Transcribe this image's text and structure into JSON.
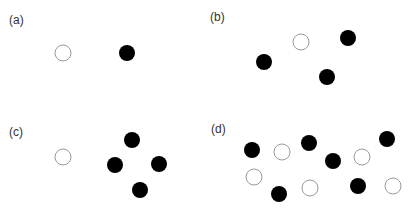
{
  "figure": {
    "panels": [
      {
        "label": "(a)",
        "label_pos": [
          9,
          14
        ],
        "circles": [
          {
            "x": 63,
            "y": 53,
            "filled": false
          },
          {
            "x": 127,
            "y": 53,
            "filled": true
          }
        ]
      },
      {
        "label": "(b)",
        "label_pos": [
          210,
          11
        ],
        "circles": [
          {
            "x": 301,
            "y": 42,
            "filled": false
          },
          {
            "x": 348,
            "y": 38,
            "filled": true
          },
          {
            "x": 264,
            "y": 62,
            "filled": true
          },
          {
            "x": 327,
            "y": 77,
            "filled": true
          }
        ]
      },
      {
        "label": "(c)",
        "label_pos": [
          9,
          126
        ],
        "circles": [
          {
            "x": 63,
            "y": 157,
            "filled": false
          },
          {
            "x": 132,
            "y": 140,
            "filled": true
          },
          {
            "x": 115,
            "y": 165,
            "filled": true
          },
          {
            "x": 159,
            "y": 164,
            "filled": true
          },
          {
            "x": 140,
            "y": 190,
            "filled": true
          }
        ]
      },
      {
        "label": "(d)",
        "label_pos": [
          211,
          123
        ],
        "circles": [
          {
            "x": 252,
            "y": 150,
            "filled": true
          },
          {
            "x": 282,
            "y": 152,
            "filled": false
          },
          {
            "x": 309,
            "y": 143,
            "filled": true
          },
          {
            "x": 333,
            "y": 161,
            "filled": true
          },
          {
            "x": 362,
            "y": 157,
            "filled": false
          },
          {
            "x": 387,
            "y": 139,
            "filled": true
          },
          {
            "x": 254,
            "y": 177,
            "filled": false
          },
          {
            "x": 279,
            "y": 194,
            "filled": true
          },
          {
            "x": 310,
            "y": 188,
            "filled": false
          },
          {
            "x": 358,
            "y": 186,
            "filled": true
          },
          {
            "x": 393,
            "y": 186,
            "filled": false
          }
        ]
      }
    ],
    "circle_radius": 8,
    "colors": {
      "filled": "#000000",
      "open_stroke": "#9a9a9a",
      "open_fill": "#ffffff",
      "label": "#333333"
    }
  }
}
